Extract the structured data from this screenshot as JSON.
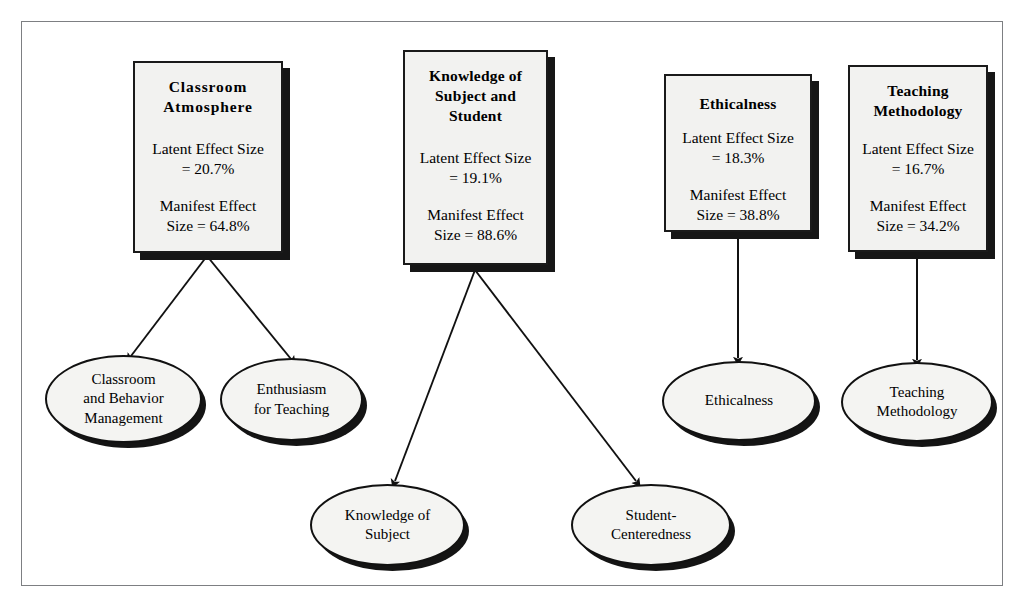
{
  "figure": {
    "type": "path-model-diagram",
    "background_color": "#ffffff",
    "frame_color": "#7d7f82",
    "node_fill": "#f2f2f0",
    "node_border": "#1a1a1a",
    "shadow_color": "#161616"
  },
  "latent_boxes": [
    {
      "id": "classroom-atmosphere",
      "title": "Classroom\nAtmosphere",
      "latent_effect_label": "Latent Effect Size\n= 20.7%",
      "manifest_effect_label": "Manifest Effect\nSize = 64.8%",
      "latent_effect_size": "20.7%",
      "manifest_effect_size": "64.8%"
    },
    {
      "id": "knowledge-of-subject-and-student",
      "title": "Knowledge of\nSubject and\nStudent",
      "latent_effect_label": "Latent Effect Size\n= 19.1%",
      "manifest_effect_label": "Manifest Effect\nSize = 88.6%",
      "latent_effect_size": "19.1%",
      "manifest_effect_size": "88.6%"
    },
    {
      "id": "ethicalness",
      "title": "Ethicalness",
      "latent_effect_label": "Latent Effect Size\n= 18.3%",
      "manifest_effect_label": "Manifest Effect\nSize = 38.8%",
      "latent_effect_size": "18.3%",
      "manifest_effect_size": "38.8%"
    },
    {
      "id": "teaching-methodology",
      "title": "Teaching\nMethodology",
      "latent_effect_label": "Latent Effect Size\n= 16.7%",
      "manifest_effect_label": "Manifest Effect\nSize = 34.2%",
      "latent_effect_size": "16.7%",
      "manifest_effect_size": "34.2%"
    }
  ],
  "indicator_ellipses": [
    {
      "id": "classroom-and-behavior-management",
      "label": "Classroom\nand Behavior\nManagement"
    },
    {
      "id": "enthusiasm-for-teaching",
      "label": "Enthusiasm\nfor Teaching"
    },
    {
      "id": "knowledge-of-subject",
      "label": "Knowledge of\nSubject"
    },
    {
      "id": "student-centeredness",
      "label": "Student-\nCenteredness"
    },
    {
      "id": "ethicalness-indicator",
      "label": "Ethicalness"
    },
    {
      "id": "teaching-methodology-indicator",
      "label": "Teaching\nMethodology"
    }
  ],
  "connections": [
    {
      "from": "classroom-atmosphere",
      "to": "classroom-and-behavior-management"
    },
    {
      "from": "classroom-atmosphere",
      "to": "enthusiasm-for-teaching"
    },
    {
      "from": "knowledge-of-subject-and-student",
      "to": "knowledge-of-subject"
    },
    {
      "from": "knowledge-of-subject-and-student",
      "to": "student-centeredness"
    },
    {
      "from": "ethicalness",
      "to": "ethicalness-indicator"
    },
    {
      "from": "teaching-methodology",
      "to": "teaching-methodology-indicator"
    }
  ]
}
